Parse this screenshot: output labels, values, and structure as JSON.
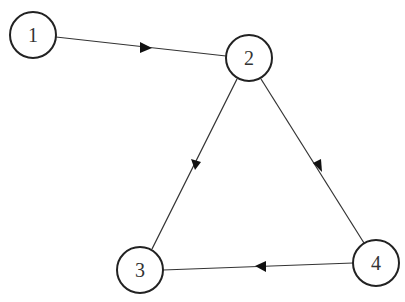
{
  "diagram": {
    "type": "directed-graph",
    "nodes": [
      {
        "id": "1",
        "label": "1",
        "x": 33,
        "y": 35,
        "r": 23
      },
      {
        "id": "2",
        "label": "2",
        "x": 249,
        "y": 58,
        "r": 23
      },
      {
        "id": "3",
        "label": "3",
        "x": 140,
        "y": 270,
        "r": 23
      },
      {
        "id": "4",
        "label": "4",
        "x": 376,
        "y": 263,
        "r": 23
      }
    ],
    "edges": [
      {
        "from": "1",
        "to": "2"
      },
      {
        "from": "2",
        "to": "3"
      },
      {
        "from": "2",
        "to": "4"
      },
      {
        "from": "4",
        "to": "3"
      }
    ],
    "colors": {
      "stroke": "#222222",
      "background": "#ffffff"
    }
  }
}
